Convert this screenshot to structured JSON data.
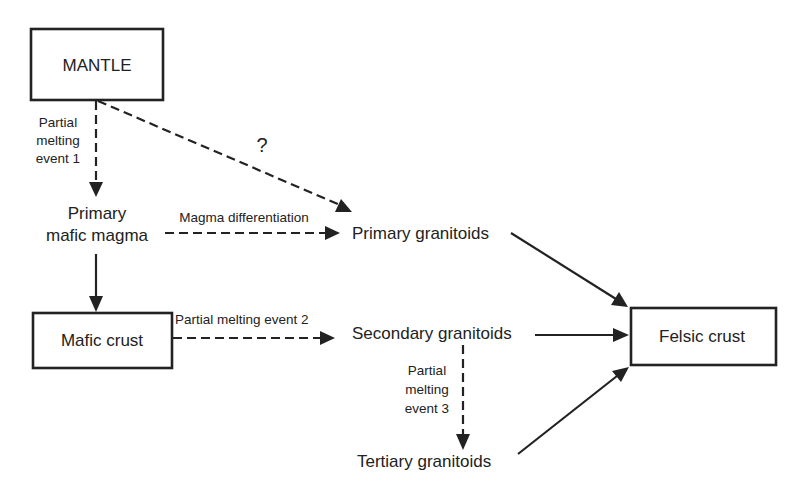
{
  "diagram": {
    "nodes": {
      "mantle": {
        "label": "MANTLE",
        "shape": "box"
      },
      "primary_mafic_magma": {
        "line1": "Primary",
        "line2": "mafic magma",
        "shape": "text"
      },
      "mafic_crust": {
        "label": "Mafic crust",
        "shape": "box"
      },
      "primary_granitoids": {
        "label": "Primary granitoids",
        "shape": "text"
      },
      "secondary_granitoids": {
        "label": "Secondary granitoids",
        "shape": "text"
      },
      "tertiary_granitoids": {
        "label": "Tertiary granitoids",
        "shape": "text"
      },
      "felsic_crust": {
        "label": "Felsic crust",
        "shape": "box"
      }
    },
    "edges": {
      "pme1": {
        "from": "MANTLE",
        "to": "Primary mafic magma",
        "style": "dashed",
        "line1": "Partial",
        "line2": "melting",
        "line3": "event 1"
      },
      "uncertain": {
        "from": "MANTLE",
        "to": "Primary granitoids",
        "style": "dashed",
        "label": "?"
      },
      "differentiation": {
        "from": "Primary mafic magma",
        "to": "Primary granitoids",
        "style": "dashed",
        "label": "Magma differentiation"
      },
      "magma_to_crust": {
        "from": "Primary mafic magma",
        "to": "Mafic crust",
        "style": "solid"
      },
      "pme2": {
        "from": "Mafic crust",
        "to": "Secondary granitoids",
        "style": "dashed",
        "label": "Partial melting event 2"
      },
      "pme3": {
        "from": "Secondary granitoids",
        "to": "Tertiary granitoids",
        "style": "dashed",
        "line1": "Partial",
        "line2": "melting",
        "line3": "event 3"
      },
      "primary_to_felsic": {
        "from": "Primary granitoids",
        "to": "Felsic crust",
        "style": "solid"
      },
      "secondary_to_felsic": {
        "from": "Secondary granitoids",
        "to": "Felsic crust",
        "style": "solid"
      },
      "tertiary_to_felsic": {
        "from": "Tertiary granitoids",
        "to": "Felsic crust",
        "style": "solid"
      }
    }
  }
}
